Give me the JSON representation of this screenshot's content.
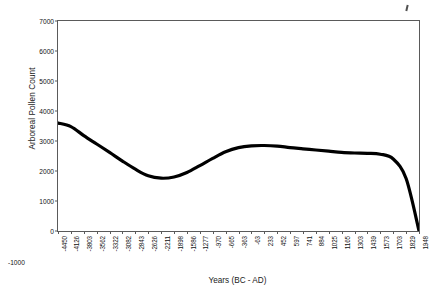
{
  "chart_data": {
    "type": "line",
    "title": "",
    "xlabel": "Years (BC - AD)",
    "ylabel": "Arboreal Pollen Count",
    "ylim": [
      -1000,
      7000
    ],
    "yticks": [
      7000,
      6000,
      5000,
      4000,
      3000,
      2000,
      1000,
      0,
      -1000
    ],
    "ytick_labels": [
      "7000",
      "6000",
      "5000",
      "4000",
      "3000",
      "2000",
      "1000",
      "0",
      "-1000"
    ],
    "grid": false,
    "legend": "none",
    "line_color": "#000000",
    "categories": [
      "-4450",
      "-4126",
      "-3803",
      "-3562",
      "-3322",
      "-3082",
      "-2843",
      "-2626",
      "-2211",
      "-1898",
      "-1586",
      "-1277",
      "-970",
      "-665",
      "-363",
      "-63",
      "233",
      "452",
      "597",
      "741",
      "884",
      "1025",
      "1165",
      "1303",
      "1439",
      "1573",
      "1703",
      "1829",
      "1948"
    ],
    "values": [
      3600,
      3480,
      3180,
      2900,
      2620,
      2330,
      2060,
      1840,
      1760,
      1800,
      1950,
      2180,
      2420,
      2640,
      2780,
      2840,
      2850,
      2830,
      2780,
      2740,
      2700,
      2660,
      2620,
      2600,
      2590,
      2560,
      2400,
      1750,
      10
    ],
    "annotations": [
      {
        "name": "scan-artifact",
        "description": "small stray ink mark above plot, top-right"
      }
    ]
  },
  "axes": {
    "x_title": "Years (BC - AD)",
    "y_title": "Arboreal Pollen Count"
  }
}
